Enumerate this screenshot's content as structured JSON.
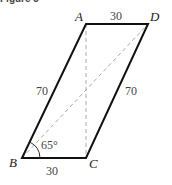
{
  "caption": "Figure 3",
  "figure": {
    "type": "parallelogram",
    "vertices": {
      "A": "A",
      "B": "B",
      "C": "C",
      "D": "D"
    },
    "side_labels": {
      "AD": "30",
      "BC": "30",
      "AB": "70",
      "CD": "70"
    },
    "angle_label": "65°",
    "dashed_lines": [
      "AC (vertical)",
      "BD (diagonal)"
    ],
    "colors": {
      "solid": "#111111",
      "dashed": "#aaaaaa"
    }
  }
}
